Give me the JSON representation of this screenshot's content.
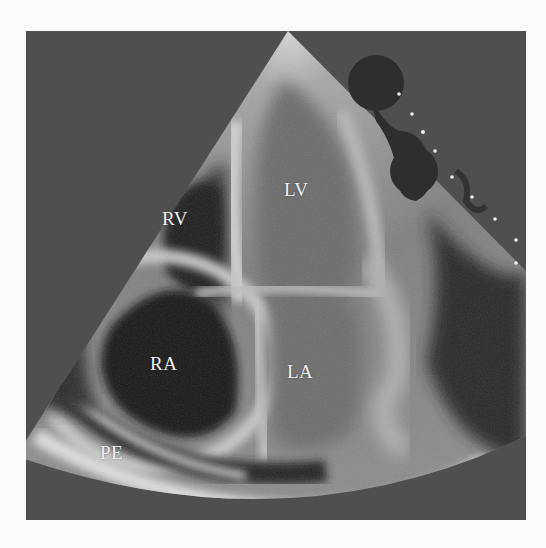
{
  "image": {
    "type": "echocardiogram",
    "view": "apical four-chamber",
    "colors": {
      "page_background": "#fbfbfa",
      "frame_background": "#4f4f4f",
      "sector_tissue": "#8a8a8a",
      "chamber_dark": "#1c1c1c",
      "label_text": "#f2f2f2"
    }
  },
  "labels": [
    {
      "id": "rv",
      "text": "RV",
      "x": 162,
      "y": 209
    },
    {
      "id": "lv",
      "text": "LV",
      "x": 284,
      "y": 180
    },
    {
      "id": "ra",
      "text": "RA",
      "x": 150,
      "y": 354
    },
    {
      "id": "la",
      "text": "LA",
      "x": 287,
      "y": 362
    },
    {
      "id": "pe",
      "text": "PE",
      "x": 100,
      "y": 443
    }
  ],
  "icons": {
    "ecg_marker": "heart-position-marker-icon",
    "depth_markers": "depth-scale-dots"
  }
}
